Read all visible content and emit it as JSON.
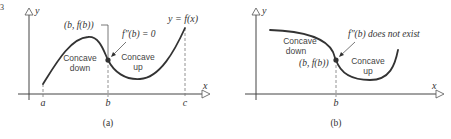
{
  "figure": {
    "corner_mark": "3",
    "panels": [
      {
        "id": "a",
        "caption": "(a)",
        "axis_labels": {
          "x": "x",
          "y": "y"
        },
        "function_label": "y = f(x)",
        "point_label": "(b, f(b))",
        "condition_label": "f″(b) = 0",
        "regions": [
          {
            "line1": "Concave",
            "line2": "down"
          },
          {
            "line1": "Concave",
            "line2": "up"
          }
        ],
        "ticks": [
          "a",
          "b",
          "c"
        ]
      },
      {
        "id": "b",
        "caption": "(b)",
        "axis_labels": {
          "x": "x",
          "y": "y"
        },
        "point_label": "(b, f(b))",
        "condition_label": "f″(b) does not exist",
        "regions": [
          {
            "line1": "Concave",
            "line2": "down"
          },
          {
            "line1": "Concave",
            "line2": "up"
          }
        ],
        "ticks": [
          "b"
        ]
      }
    ]
  },
  "colors": {
    "ink": "#333333",
    "axis": "#444444",
    "dash": "#777777",
    "background": "#ffffff"
  }
}
